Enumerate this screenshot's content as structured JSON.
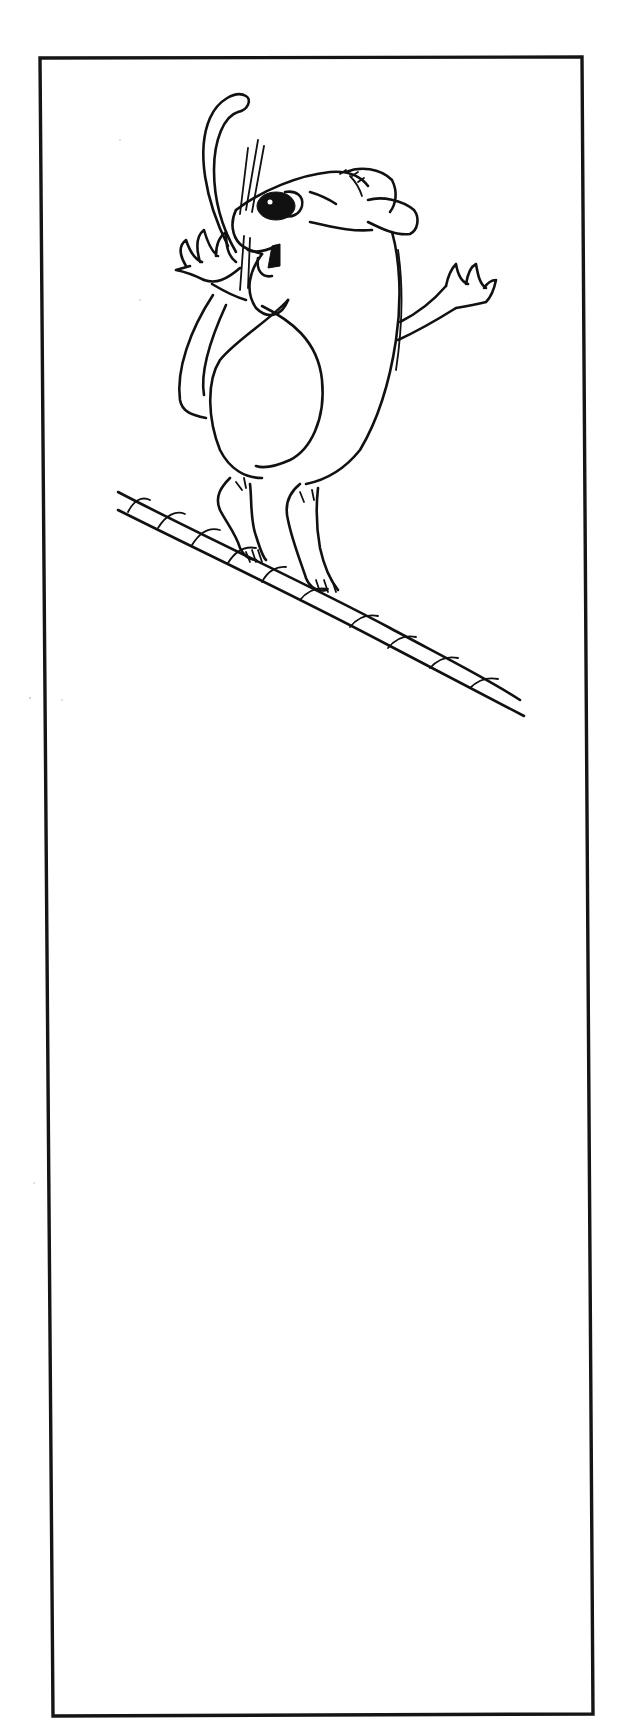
{
  "page": {
    "kind": "line-art illustration",
    "width": 628,
    "height": 1723
  },
  "colors": {
    "background": "#ffffff",
    "ink": "#111111",
    "frame": "#151515"
  },
  "frame": {
    "top_left": [
      40,
      58
    ],
    "top_right": [
      582,
      57
    ],
    "bottom_right": [
      593,
      1714
    ],
    "bottom_left": [
      53,
      1716
    ]
  },
  "illustration": {
    "figure": "mouse-icon",
    "prop": "rope-icon",
    "blank_area_below": true
  }
}
